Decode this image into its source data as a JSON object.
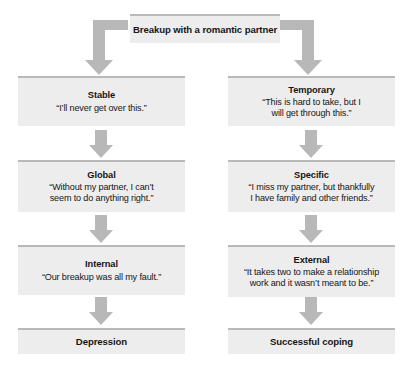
{
  "diagram": {
    "colors": {
      "box_fill": "#ededed",
      "box_top_border": "#b9b9b9",
      "arrow_fill": "#b5b5b5",
      "text": "#161616",
      "background": "#ffffff"
    }
  },
  "root": {
    "label": "Breakup with a romantic partner"
  },
  "left_branch": {
    "row1": {
      "title": "Stable",
      "quote_lines": [
        "“I’ll never get over this.”"
      ]
    },
    "row2": {
      "title": "Global",
      "quote_lines": [
        "“Without my partner, I can’t",
        "seem to do anything right.”"
      ]
    },
    "row3": {
      "title": "Internal",
      "quote_lines": [
        "“Our breakup was all my fault.”"
      ]
    },
    "outcome": {
      "title": "Depression"
    }
  },
  "right_branch": {
    "row1": {
      "title": "Temporary",
      "quote_lines": [
        "“This is hard to take, but I",
        "will get through this.”"
      ]
    },
    "row2": {
      "title": "Specific",
      "quote_lines": [
        "“I miss my partner, but thankfully",
        "I have family and other friends.”"
      ]
    },
    "row3": {
      "title": "External",
      "quote_lines": [
        "“It takes two to make a relationship",
        "work and it wasn’t meant to be.”"
      ]
    },
    "outcome": {
      "title": "Successful coping"
    }
  },
  "connectors": {
    "root_to_left": "elbow-arrow-down-left",
    "root_to_right": "elbow-arrow-down-right",
    "left_1_2": "arrow-down",
    "left_2_3": "arrow-down",
    "left_3_outcome": "arrow-down",
    "right_1_2": "arrow-down",
    "right_2_3": "arrow-down",
    "right_3_outcome": "arrow-down"
  }
}
